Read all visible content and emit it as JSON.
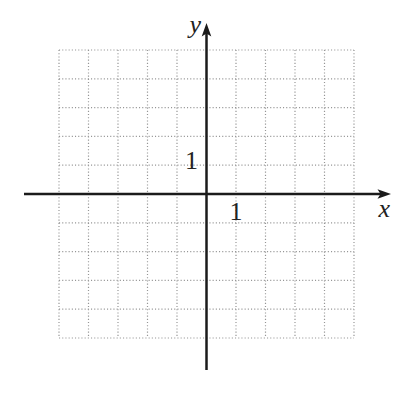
{
  "figure": {
    "x_axis_label": "x",
    "y_axis_label": "y",
    "x_tick_label": "1",
    "y_tick_label": "1",
    "colors": {
      "background": "#ffffff",
      "axis": "#1b1b1b",
      "grid_dots": "#969696",
      "labels": "#222222"
    }
  },
  "chart_data": {
    "type": "scatter",
    "title": "",
    "xlabel": "x",
    "ylabel": "y",
    "xlim": [
      -5,
      5
    ],
    "ylim": [
      -5,
      5
    ],
    "grid": "dotted",
    "grid_step": 1,
    "x_ticks_labeled": [
      1
    ],
    "y_ticks_labeled": [
      1
    ],
    "legend": "none",
    "series": []
  }
}
